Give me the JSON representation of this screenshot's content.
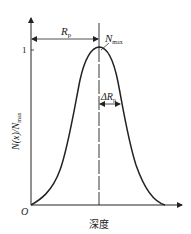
{
  "diagram": {
    "type": "ion-implantation-depth-profile",
    "y_axis_label": "N(x)/N",
    "y_axis_label_sub": "max",
    "y_tick_label": "1",
    "x_axis_label": "深度",
    "origin_label": "O",
    "peak_label": "N",
    "peak_label_sub": "max",
    "range_label": "R",
    "range_label_sub": "p",
    "straggle_label": "ΔR",
    "straggle_label_sub": "p",
    "colors": {
      "line": "#222222",
      "background": "#ffffff"
    }
  }
}
